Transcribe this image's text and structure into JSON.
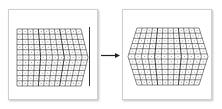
{
  "diagram": {
    "left": {
      "label": "",
      "columns": 12,
      "rows": 11,
      "shape": "right-chevron",
      "has_reference_line": true
    },
    "arrow": {
      "direction": "right"
    },
    "right": {
      "label": "",
      "columns": 12,
      "rows": 11,
      "shape": "hexagon"
    },
    "colors": {
      "grid_line": "#333333",
      "cell_dot": "#9a9a9a",
      "panel_border": "#cfcfcf",
      "arrow": "#222222"
    }
  }
}
